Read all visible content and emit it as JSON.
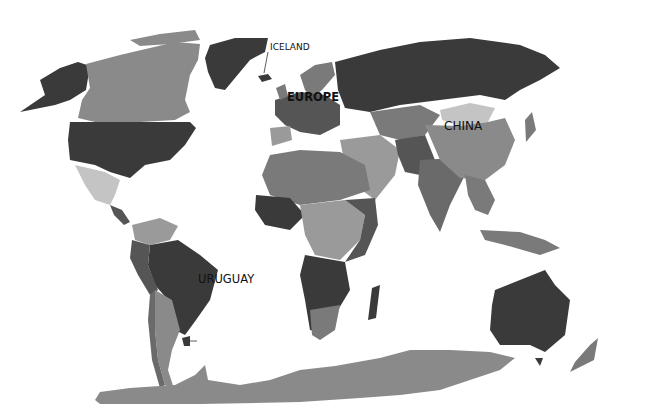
{
  "map": {
    "type": "choropleth",
    "projection": "world",
    "palette": {
      "darkest": "#3a3a3a",
      "dark": "#555555",
      "mid": "#7a7a7a",
      "light": "#9a9a9a",
      "lightest": "#c4c4c4",
      "ocean": "#ffffff",
      "antarctica": "#8a8a8a"
    },
    "labels": [
      {
        "id": "iceland",
        "text": "ICELAND"
      },
      {
        "id": "europe",
        "text": "EUROPE"
      },
      {
        "id": "china",
        "text": "CHINA"
      },
      {
        "id": "uruguay",
        "text": "URUGUAY"
      }
    ]
  }
}
